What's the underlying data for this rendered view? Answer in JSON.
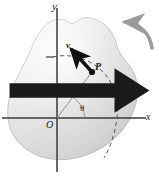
{
  "axes": {
    "x_label": "x",
    "y_label": "y",
    "origin_label": "O"
  },
  "labels": {
    "point": "P",
    "radius": "r",
    "angle": "θ",
    "arc_length": "s",
    "velocity": "v"
  },
  "icons": {
    "velocity_arrow": "vector-arrow-icon",
    "rotation_arrow": "curved-rotation-arrow-icon"
  },
  "colors": {
    "body_fill_light": "#f2f2f2",
    "body_fill_mid": "#dcdcdc",
    "body_fill_dark": "#c4c4c4",
    "body_outline": "#a8a8a8",
    "axis": "#3a3a3a",
    "vector": "#111111",
    "dashed": "#555555",
    "rotation_arrow": "#9a9a9a",
    "text": "#1a1a1a"
  },
  "geometry": {
    "origin_px": [
      57,
      118
    ],
    "point_p_px": [
      92,
      72
    ],
    "radius_px": 58,
    "theta_degrees": 53
  }
}
